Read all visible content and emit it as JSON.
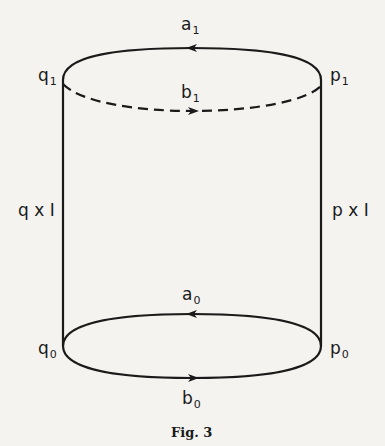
{
  "figure": {
    "caption": "Fig. 3",
    "colors": {
      "ink": "#1a1a1a",
      "paper": "#f4f3f0"
    },
    "labels": {
      "a1": {
        "base": "a",
        "sub": "1"
      },
      "b1": {
        "base": "b",
        "sub": "1"
      },
      "q1": {
        "base": "q",
        "sub": "1"
      },
      "p1": {
        "base": "p",
        "sub": "1"
      },
      "a0": {
        "base": "a",
        "sub": "0"
      },
      "b0": {
        "base": "b",
        "sub": "0"
      },
      "q0": {
        "base": "q",
        "sub": "0"
      },
      "p0": {
        "base": "p",
        "sub": "0"
      },
      "qxI": "q x I",
      "pxI": "p x I"
    }
  }
}
